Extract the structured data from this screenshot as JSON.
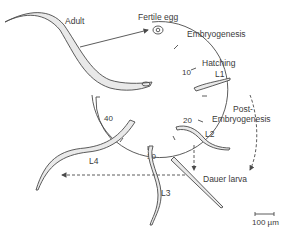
{
  "labels": {
    "adult": "Adult",
    "fertile_egg": "Fertile egg",
    "embryogenesis": "Embryogenesis",
    "hatching": "Hatching",
    "l1": "L1",
    "l2": "L2",
    "l3": "L3",
    "l4": "L4",
    "post": "Post-",
    "post_embryogenesis": "Embryogenesis",
    "dauer": "Dauer larva"
  },
  "clock_ticks": [
    "10",
    "20",
    "30",
    "40"
  ],
  "scale_bar": "100 µm",
  "colors": {
    "line": "#4a4a4a",
    "worm_fill": "#e9e9e9",
    "text": "#3a3a3a"
  }
}
